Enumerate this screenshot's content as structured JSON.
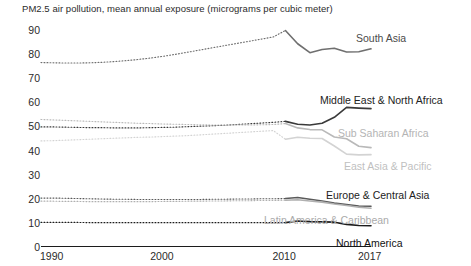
{
  "chart_data": {
    "type": "line",
    "title": "PM2.5 air pollution, mean annual exposure (micrograms per cubic meter)",
    "xlabel": "",
    "ylabel": "",
    "xlim": [
      1990,
      2017
    ],
    "ylim": [
      0,
      92
    ],
    "grid": false,
    "legend_position": "right-inline",
    "ytick_labels": [
      "90",
      "80",
      "70",
      "60",
      "50",
      "40",
      "30",
      "20",
      "10",
      "0"
    ],
    "ytick_values": [
      90,
      80,
      70,
      60,
      50,
      40,
      30,
      20,
      10,
      0
    ],
    "xtick_labels": [
      "1990",
      "2000",
      "2010",
      "2017"
    ],
    "xtick_values": [
      1990,
      2000,
      2010,
      2017
    ],
    "note": "Segments from 1990-2010 are drawn dotted (interpolated/estimated); 2010-2017 drawn solid (observed).",
    "x": [
      1990,
      1991,
      1992,
      1993,
      1994,
      1995,
      1996,
      1997,
      1998,
      1999,
      2000,
      2001,
      2002,
      2003,
      2004,
      2005,
      2006,
      2007,
      2008,
      2009,
      2010,
      2011,
      2012,
      2013,
      2014,
      2015,
      2016,
      2017
    ],
    "series": [
      {
        "name": "South Asia",
        "color": "#6f6f6f",
        "label_color": "#4a4a4a",
        "values": [
          76.5,
          76.4,
          76.3,
          76.3,
          76.4,
          76.6,
          76.9,
          77.3,
          77.8,
          78.4,
          79.1,
          79.9,
          80.8,
          81.7,
          82.6,
          83.5,
          84.4,
          85.3,
          86.2,
          87.1,
          89.8,
          84.3,
          80.6,
          81.9,
          82.4,
          80.9,
          81.0,
          82.2
        ]
      },
      {
        "name": "Middle East & North Africa",
        "color": "#3a3a3a",
        "label_color": "#222222",
        "values": [
          49.8,
          49.8,
          49.7,
          49.6,
          49.5,
          49.5,
          49.4,
          49.4,
          49.4,
          49.5,
          49.6,
          49.7,
          49.9,
          50.1,
          50.3,
          50.5,
          50.8,
          51.1,
          51.4,
          51.7,
          52.1,
          50.9,
          50.6,
          51.3,
          53.8,
          57.9,
          57.6,
          57.4
        ]
      },
      {
        "name": "Sub Saharan Africa",
        "color": "#b9b9b9",
        "label_color": "#b4b4b4",
        "values": [
          52.9,
          52.7,
          52.5,
          52.3,
          52.1,
          51.9,
          51.7,
          51.5,
          51.3,
          51.2,
          51.0,
          50.9,
          50.8,
          50.7,
          50.6,
          50.6,
          50.6,
          50.6,
          50.7,
          50.8,
          51.2,
          49.4,
          48.7,
          48.6,
          45.6,
          44.9,
          41.8,
          41.2
        ]
      },
      {
        "name": "East Asia & Pacific",
        "color": "#d3d3d3",
        "label_color": "#bfbfbf",
        "values": [
          44.0,
          44.1,
          44.3,
          44.5,
          44.7,
          44.9,
          45.1,
          45.3,
          45.5,
          45.6,
          45.8,
          46.0,
          46.2,
          46.5,
          46.8,
          47.1,
          47.4,
          47.7,
          48.0,
          48.3,
          44.7,
          45.5,
          45.1,
          45.0,
          41.9,
          38.5,
          38.2,
          38.3
        ]
      },
      {
        "name": "Europe & Central Asia",
        "color": "#5a5a5a",
        "label_color": "#222222",
        "values": [
          20.3,
          20.3,
          20.2,
          20.1,
          20.0,
          19.9,
          19.8,
          19.8,
          19.7,
          19.7,
          19.7,
          19.7,
          19.7,
          19.7,
          19.8,
          19.8,
          19.9,
          19.9,
          20.0,
          20.0,
          20.1,
          20.5,
          19.8,
          19.1,
          18.2,
          17.6,
          17.0,
          16.9
        ]
      },
      {
        "name": "Latin America & Caribbean",
        "color": "#b0b0b0",
        "label_color": "#aaaaaa",
        "values": [
          19.0,
          19.0,
          18.9,
          18.9,
          18.8,
          18.8,
          18.8,
          18.8,
          18.8,
          18.8,
          18.9,
          18.9,
          19.0,
          19.0,
          19.1,
          19.1,
          19.2,
          19.2,
          19.3,
          19.3,
          19.4,
          19.6,
          19.1,
          18.6,
          17.8,
          17.2,
          16.5,
          16.1
        ]
      },
      {
        "name": "North America",
        "color": "#1c1c1c",
        "label_color": "#111111",
        "values": [
          10.2,
          10.2,
          10.2,
          10.2,
          10.1,
          10.1,
          10.1,
          10.1,
          10.1,
          10.1,
          10.1,
          10.1,
          10.1,
          10.1,
          10.1,
          10.1,
          10.1,
          10.1,
          10.1,
          10.1,
          10.1,
          10.8,
          10.5,
          10.4,
          10.3,
          9.4,
          8.9,
          8.8
        ]
      }
    ],
    "annotations": [
      {
        "text": "South Asia",
        "x_px": 356,
        "y_px": 33
      },
      {
        "text": "Middle East & North Africa",
        "x_px": 320,
        "y_px": 95
      },
      {
        "text": "Sub Saharan Africa",
        "x_px": 338,
        "y_px": 128
      },
      {
        "text": "East Asia & Pacific",
        "x_px": 344,
        "y_px": 161
      },
      {
        "text": "Europe & Central Asia",
        "x_px": 326,
        "y_px": 190
      },
      {
        "text": "Latin America & Caribbean",
        "x_px": 264,
        "y_px": 215
      },
      {
        "text": "North America",
        "x_px": 336,
        "y_px": 238
      }
    ]
  }
}
